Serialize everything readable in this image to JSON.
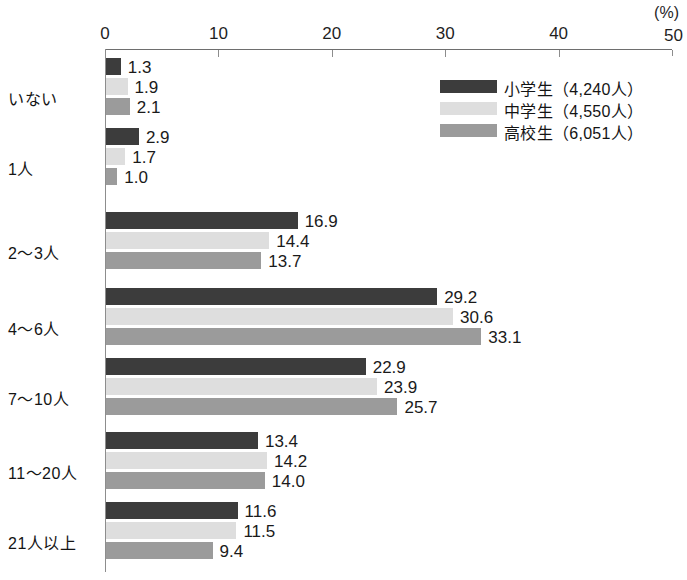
{
  "chart_data": {
    "type": "bar",
    "orientation": "horizontal",
    "title": "",
    "xlabel": "(%)",
    "ylabel": "",
    "xlim": [
      0,
      50
    ],
    "xticks": [
      0,
      10,
      20,
      30,
      40,
      50
    ],
    "grid": false,
    "legend_position": "top-right",
    "categories": [
      "いない",
      "1人",
      "2～3人",
      "4～6人",
      "7～10人",
      "11～20人",
      "21人以上"
    ],
    "series": [
      {
        "name": "小学生（4,240人）",
        "color": "#3c3c3c",
        "values": [
          1.3,
          2.9,
          16.9,
          29.2,
          22.9,
          13.4,
          11.6
        ]
      },
      {
        "name": "中学生（4,550人）",
        "color": "#dedede",
        "values": [
          1.9,
          1.7,
          14.4,
          30.6,
          23.9,
          14.2,
          11.5
        ]
      },
      {
        "name": "高校生（6,051人）",
        "color": "#9b9b9b",
        "values": [
          2.1,
          1.0,
          13.7,
          33.1,
          25.7,
          14.0,
          9.4
        ]
      }
    ]
  },
  "axis": {
    "unit_label": "(%)",
    "tick_labels": [
      "0",
      "10",
      "20",
      "30",
      "40",
      "50"
    ]
  },
  "title_remnant": "",
  "colors": {
    "series_primary": "#3c3c3c",
    "series_secondary": "#dedede",
    "series_tertiary": "#9b9b9b",
    "axis": "#8d8d8d",
    "text": "#1a1a1a",
    "background": "#ffffff"
  }
}
